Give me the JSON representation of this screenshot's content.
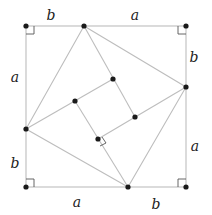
{
  "diagram": {
    "colors": {
      "line": "#bdbdbd",
      "point": "#1a1a1a",
      "label": "#222222",
      "right_angle": "#555555"
    },
    "labels": {
      "top_left": "b",
      "top_right": "a",
      "left_upper": "a",
      "left_lower": "b",
      "right_upper": "b",
      "right_lower": "a",
      "bottom_left": "a",
      "bottom_right": "b"
    },
    "outer_square": [
      [
        26,
        26
      ],
      [
        186,
        26
      ],
      [
        186,
        187
      ],
      [
        26,
        187
      ]
    ],
    "side_points": {
      "top": [
        84,
        26
      ],
      "right": [
        186,
        87
      ],
      "bottom": [
        128,
        187
      ],
      "left": [
        26,
        129
      ]
    },
    "inner_square": [
      [
        75,
        101
      ],
      [
        113,
        79
      ],
      [
        135,
        117
      ],
      [
        98,
        139
      ]
    ],
    "right_angle_markers": [
      "outer-top-left",
      "outer-top-right",
      "outer-bottom-right",
      "outer-bottom-left",
      "inner-bottom"
    ]
  }
}
